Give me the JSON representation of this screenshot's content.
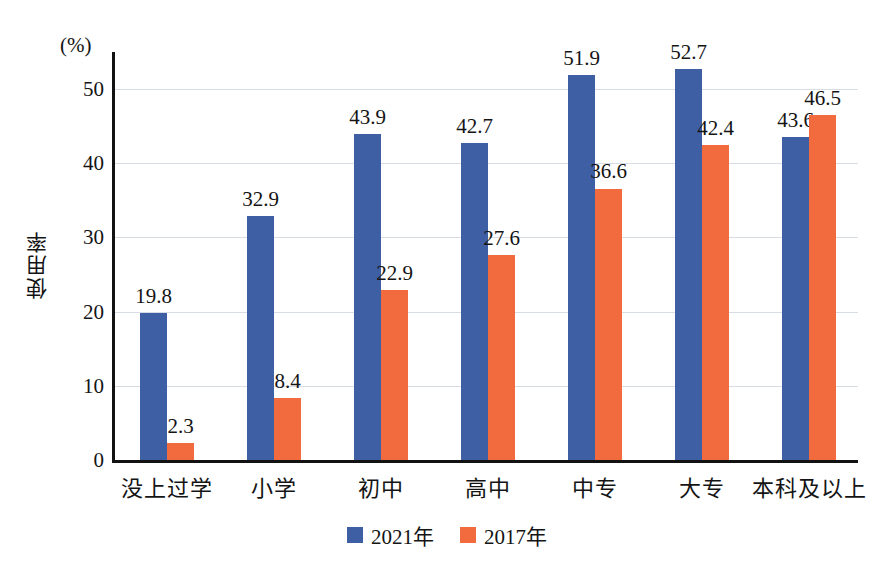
{
  "chart_data": {
    "type": "bar",
    "title": "",
    "subtitle": "",
    "xlabel": "",
    "ylabel": "使用率",
    "unit_label": "(%)",
    "categories": [
      "没上过学",
      "小学",
      "初中",
      "高中",
      "中专",
      "大专",
      "本科及以上"
    ],
    "series": [
      {
        "name": "2021年",
        "color": "#3f5fa5",
        "values": [
          19.8,
          32.9,
          43.9,
          42.7,
          51.9,
          52.7,
          43.6
        ]
      },
      {
        "name": "2017年",
        "color": "#f26b3e",
        "values": [
          2.3,
          8.4,
          22.9,
          27.6,
          36.6,
          42.4,
          46.5
        ]
      }
    ],
    "ylim": [
      0,
      55
    ],
    "yticks": [
      0,
      10,
      20,
      30,
      40,
      50
    ],
    "ytick_labels": [
      "0",
      "10",
      "20",
      "30",
      "40",
      "50"
    ],
    "grid": true,
    "grid_color": "#d8dce4",
    "legend_position": "bottom",
    "data_labels": true,
    "background": "#ffffff",
    "axis_color": "#121212"
  }
}
